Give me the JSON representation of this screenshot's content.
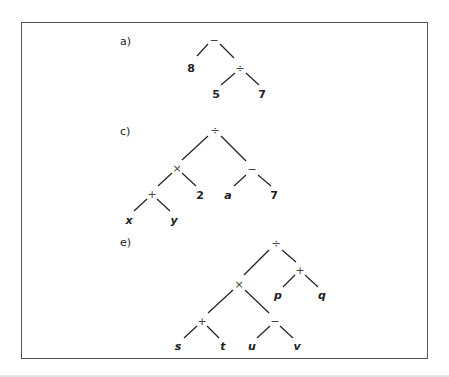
{
  "figure": {
    "trees": [
      {
        "label": "a)",
        "label_pos": [
          120,
          45
        ],
        "nodes": [
          {
            "id": "n1",
            "text": "−",
            "kind": "op",
            "x": 214,
            "y": 41
          },
          {
            "id": "n2",
            "text": "8",
            "kind": "num",
            "x": 191,
            "y": 69
          },
          {
            "id": "n3",
            "text": "÷",
            "kind": "op",
            "x": 240,
            "y": 69
          },
          {
            "id": "n4",
            "text": "5",
            "kind": "num",
            "x": 216,
            "y": 95
          },
          {
            "id": "n5",
            "text": "7",
            "kind": "num",
            "x": 262,
            "y": 95
          }
        ],
        "edges": [
          [
            208,
            44,
            197,
            56
          ],
          [
            220,
            44,
            234,
            58
          ],
          [
            235,
            73,
            221,
            85
          ],
          [
            246,
            73,
            259,
            85
          ]
        ]
      },
      {
        "label": "c)",
        "label_pos": [
          120,
          135
        ],
        "nodes": [
          {
            "id": "n1",
            "text": "÷",
            "kind": "op",
            "x": 215,
            "y": 131
          },
          {
            "id": "n2",
            "text": "×",
            "kind": "op",
            "x": 177,
            "y": 169
          },
          {
            "id": "n3",
            "text": "−",
            "kind": "op",
            "x": 252,
            "y": 170
          },
          {
            "id": "n4",
            "text": "+",
            "kind": "op",
            "x": 152,
            "y": 195
          },
          {
            "id": "n5",
            "text": "2",
            "kind": "num",
            "x": 200,
            "y": 196
          },
          {
            "id": "n6",
            "text": "a",
            "kind": "var",
            "x": 228,
            "y": 196
          },
          {
            "id": "n7",
            "text": "7",
            "kind": "num",
            "x": 274,
            "y": 196
          },
          {
            "id": "n8",
            "text": "x",
            "kind": "var",
            "x": 129,
            "y": 221
          },
          {
            "id": "n9",
            "text": "y",
            "kind": "var",
            "x": 174,
            "y": 221
          }
        ],
        "edges": [
          [
            208,
            136,
            182,
            160
          ],
          [
            221,
            136,
            246,
            161
          ],
          [
            172,
            173,
            158,
            186
          ],
          [
            182,
            173,
            196,
            186
          ],
          [
            246,
            175,
            234,
            186
          ],
          [
            258,
            175,
            271,
            186
          ],
          [
            147,
            199,
            134,
            211
          ],
          [
            157,
            199,
            170,
            211
          ]
        ]
      },
      {
        "label": "e)",
        "label_pos": [
          120,
          246
        ],
        "nodes": [
          {
            "id": "n1",
            "text": "÷",
            "kind": "op",
            "x": 276,
            "y": 244
          },
          {
            "id": "n2",
            "text": "+",
            "kind": "op",
            "x": 300,
            "y": 271
          },
          {
            "id": "n3",
            "text": "p",
            "kind": "var",
            "x": 278,
            "y": 296
          },
          {
            "id": "n4",
            "text": "q",
            "kind": "var",
            "x": 322,
            "y": 296
          },
          {
            "id": "n5",
            "text": "×",
            "kind": "op",
            "x": 239,
            "y": 285
          },
          {
            "id": "n6",
            "text": "+",
            "kind": "op",
            "x": 202,
            "y": 322
          },
          {
            "id": "n7",
            "text": "−",
            "kind": "op",
            "x": 275,
            "y": 322
          },
          {
            "id": "n8",
            "text": "s",
            "kind": "var",
            "x": 178,
            "y": 347
          },
          {
            "id": "n9",
            "text": "t",
            "kind": "var",
            "x": 223,
            "y": 347
          },
          {
            "id": "n10",
            "text": "u",
            "kind": "var",
            "x": 252,
            "y": 347
          },
          {
            "id": "n11",
            "text": "v",
            "kind": "var",
            "x": 297,
            "y": 347
          }
        ],
        "edges": [
          [
            269,
            250,
            244,
            275
          ],
          [
            282,
            250,
            296,
            262
          ],
          [
            295,
            275,
            283,
            287
          ],
          [
            305,
            275,
            318,
            287
          ],
          [
            233,
            290,
            208,
            313
          ],
          [
            245,
            290,
            269,
            313
          ],
          [
            197,
            326,
            184,
            338
          ],
          [
            207,
            326,
            219,
            338
          ],
          [
            270,
            326,
            257,
            338
          ],
          [
            280,
            326,
            293,
            338
          ]
        ]
      }
    ]
  }
}
